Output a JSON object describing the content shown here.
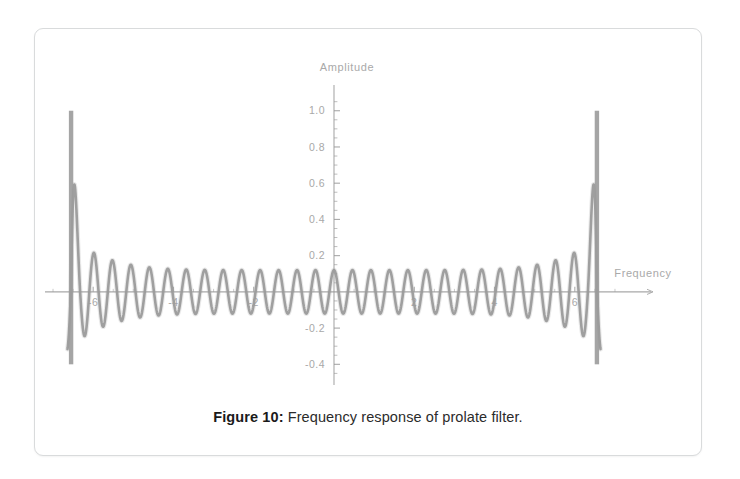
{
  "figure": {
    "caption_label": "Figure 10:",
    "caption_text": "Frequency response of prolate filter.",
    "card_border_color": "#d9dbdc",
    "background_color": "#ffffff"
  },
  "chart_data": {
    "type": "line",
    "title": "",
    "subtitle": "",
    "xlabel": "Frequency",
    "ylabel": "Amplitude",
    "xlim": [
      -7.2,
      7.2
    ],
    "ylim": [
      -0.47,
      1.12
    ],
    "xticks": [
      -6,
      -4,
      -2,
      2,
      4,
      6
    ],
    "xtick_labels": [
      "-6",
      "-4",
      "-2",
      "2",
      "4",
      "6"
    ],
    "yticks": [
      1.0,
      0.8,
      0.6,
      0.4,
      0.2,
      -0.2,
      -0.4
    ],
    "ytick_labels": [
      "1.0",
      "0.8",
      "0.6",
      "0.4",
      "0.2",
      "-0.2",
      "-0.4"
    ],
    "minor_tick_step": 0.05,
    "grid": false,
    "legend": null,
    "axis_color": "#9a9a9a",
    "tick_label_color": "#a8a8a8",
    "axis_label_color": "#a0a0a0",
    "series": [
      {
        "name": "prolate filter frequency response",
        "color": "#9b9b9b",
        "line_width": 2.6,
        "description": "Rapidly oscillating response: large positive spike to 1.0 at each band edge (x = -6.55 and x = 6.55) dropping to -0.40, with ripple oscillations of roughly +-0.12 amplitude across the passband, period about 0.46 in x; ripple envelope grows from 0.12 near the centre to 0.30 near the band edges.",
        "edge_peak_value": 1.0,
        "edge_trough_value": -0.4,
        "edge_x_left": -6.55,
        "edge_x_right": 6.55,
        "ripple_amplitude_center": 0.12,
        "ripple_amplitude_edge": 0.3,
        "ripple_period_x": 0.46,
        "ripple_cycles_visible": 29
      }
    ]
  }
}
